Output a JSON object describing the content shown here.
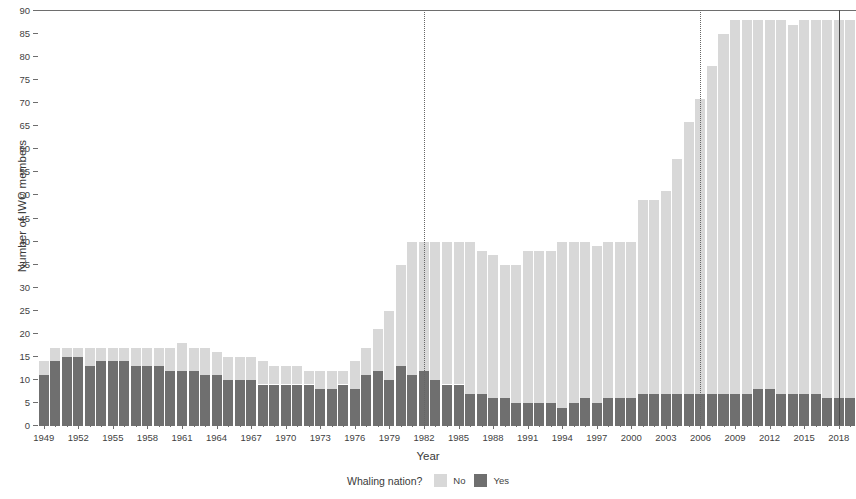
{
  "chart_data": {
    "type": "bar",
    "title": "",
    "subtitle": "",
    "xlabel": "Year",
    "ylabel": "Number of IWC members",
    "stacked": true,
    "grid": false,
    "xlim": [
      1948.5,
      2019.5
    ],
    "ylim": [
      0,
      90
    ],
    "ytick_values": [
      0,
      5,
      10,
      15,
      20,
      25,
      30,
      35,
      40,
      45,
      50,
      55,
      60,
      65,
      70,
      75,
      80,
      85,
      90
    ],
    "xtick_values": [
      1949,
      1952,
      1955,
      1958,
      1961,
      1964,
      1967,
      1970,
      1973,
      1976,
      1979,
      1982,
      1985,
      1988,
      1991,
      1994,
      1997,
      2000,
      2003,
      2006,
      2009,
      2012,
      2015,
      2018
    ],
    "legend": {
      "title": "Whaling nation?",
      "position": "bottom",
      "entries": [
        {
          "label": "No",
          "color": "#d8d8d8"
        },
        {
          "label": "Yes",
          "color": "#6f6f6f"
        }
      ]
    },
    "annotations": [
      {
        "type": "vline",
        "x": 1982,
        "style": "dotted",
        "color": "#676767"
      },
      {
        "type": "vline",
        "x": 2006,
        "style": "dotted",
        "color": "#676767"
      },
      {
        "type": "vline",
        "x": 2018,
        "style": "solid",
        "color": "#4a4a4a"
      }
    ],
    "x": [
      1949,
      1950,
      1951,
      1952,
      1953,
      1954,
      1955,
      1956,
      1957,
      1958,
      1959,
      1960,
      1961,
      1962,
      1963,
      1964,
      1965,
      1966,
      1967,
      1968,
      1969,
      1970,
      1971,
      1972,
      1973,
      1974,
      1975,
      1976,
      1977,
      1978,
      1979,
      1980,
      1981,
      1982,
      1983,
      1984,
      1985,
      1986,
      1987,
      1988,
      1989,
      1990,
      1991,
      1992,
      1993,
      1994,
      1995,
      1996,
      1997,
      1998,
      1999,
      2000,
      2001,
      2002,
      2003,
      2004,
      2005,
      2006,
      2007,
      2008,
      2009,
      2010,
      2011,
      2012,
      2013,
      2014,
      2015,
      2016,
      2017,
      2018,
      2019
    ],
    "series": [
      {
        "name": "Yes",
        "color": "#6f6f6f",
        "values": [
          11,
          14,
          15,
          15,
          13,
          14,
          14,
          14,
          13,
          13,
          13,
          12,
          12,
          12,
          11,
          11,
          10,
          10,
          10,
          9,
          9,
          9,
          9,
          9,
          8,
          8,
          9,
          8,
          11,
          12,
          10,
          13,
          11,
          12,
          10,
          9,
          9,
          7,
          7,
          6,
          6,
          5,
          5,
          5,
          5,
          4,
          5,
          6,
          5,
          6,
          6,
          6,
          7,
          7,
          7,
          7,
          7,
          7,
          7,
          7,
          7,
          7,
          8,
          8,
          7,
          7,
          7,
          7,
          6,
          6,
          6
        ]
      },
      {
        "name": "No",
        "color": "#d8d8d8",
        "values": [
          3,
          3,
          2,
          2,
          4,
          3,
          3,
          3,
          4,
          4,
          4,
          5,
          6,
          5,
          6,
          5,
          5,
          5,
          5,
          5,
          4,
          4,
          4,
          3,
          4,
          4,
          3,
          6,
          6,
          9,
          15,
          22,
          29,
          28,
          30,
          31,
          31,
          33,
          31,
          31,
          29,
          30,
          33,
          33,
          33,
          36,
          35,
          34,
          34,
          34,
          34,
          34,
          42,
          42,
          44,
          51,
          59,
          64,
          71,
          78,
          81,
          81,
          80,
          80,
          81,
          80,
          81,
          81,
          82,
          82,
          82
        ]
      }
    ],
    "totals": [
      14,
      17,
      17,
      17,
      17,
      17,
      17,
      17,
      17,
      17,
      17,
      17,
      18,
      17,
      17,
      16,
      15,
      15,
      15,
      14,
      13,
      13,
      13,
      12,
      12,
      12,
      12,
      14,
      17,
      21,
      25,
      35,
      40,
      40,
      40,
      40,
      40,
      40,
      38,
      37,
      35,
      35,
      38,
      38,
      38,
      40,
      40,
      40,
      39,
      40,
      40,
      40,
      49,
      49,
      51,
      58,
      66,
      71,
      78,
      85,
      88,
      88,
      88,
      88,
      88,
      87,
      88,
      88,
      88,
      88,
      88
    ]
  }
}
